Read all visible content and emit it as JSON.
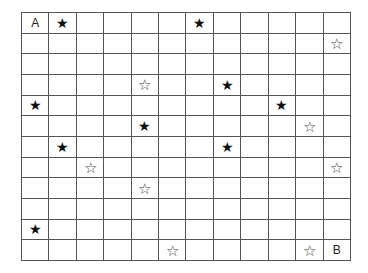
{
  "puzzle": {
    "rows": 12,
    "cols": 12,
    "icons": {
      "filled": "★",
      "outline": "☆"
    },
    "items": [
      {
        "row": 0,
        "col": 0,
        "type": "label",
        "text": "A"
      },
      {
        "row": 0,
        "col": 1,
        "type": "filled"
      },
      {
        "row": 0,
        "col": 6,
        "type": "filled"
      },
      {
        "row": 1,
        "col": 11,
        "type": "outline"
      },
      {
        "row": 3,
        "col": 4,
        "type": "outline"
      },
      {
        "row": 3,
        "col": 7,
        "type": "filled"
      },
      {
        "row": 4,
        "col": 0,
        "type": "filled"
      },
      {
        "row": 4,
        "col": 9,
        "type": "filled"
      },
      {
        "row": 5,
        "col": 4,
        "type": "filled"
      },
      {
        "row": 5,
        "col": 10,
        "type": "outline"
      },
      {
        "row": 6,
        "col": 1,
        "type": "filled"
      },
      {
        "row": 6,
        "col": 7,
        "type": "filled"
      },
      {
        "row": 7,
        "col": 2,
        "type": "outline"
      },
      {
        "row": 7,
        "col": 11,
        "type": "outline"
      },
      {
        "row": 8,
        "col": 4,
        "type": "outline"
      },
      {
        "row": 10,
        "col": 0,
        "type": "filled"
      },
      {
        "row": 11,
        "col": 5,
        "type": "outline"
      },
      {
        "row": 11,
        "col": 10,
        "type": "outline"
      },
      {
        "row": 11,
        "col": 11,
        "type": "label",
        "text": "B"
      }
    ]
  }
}
